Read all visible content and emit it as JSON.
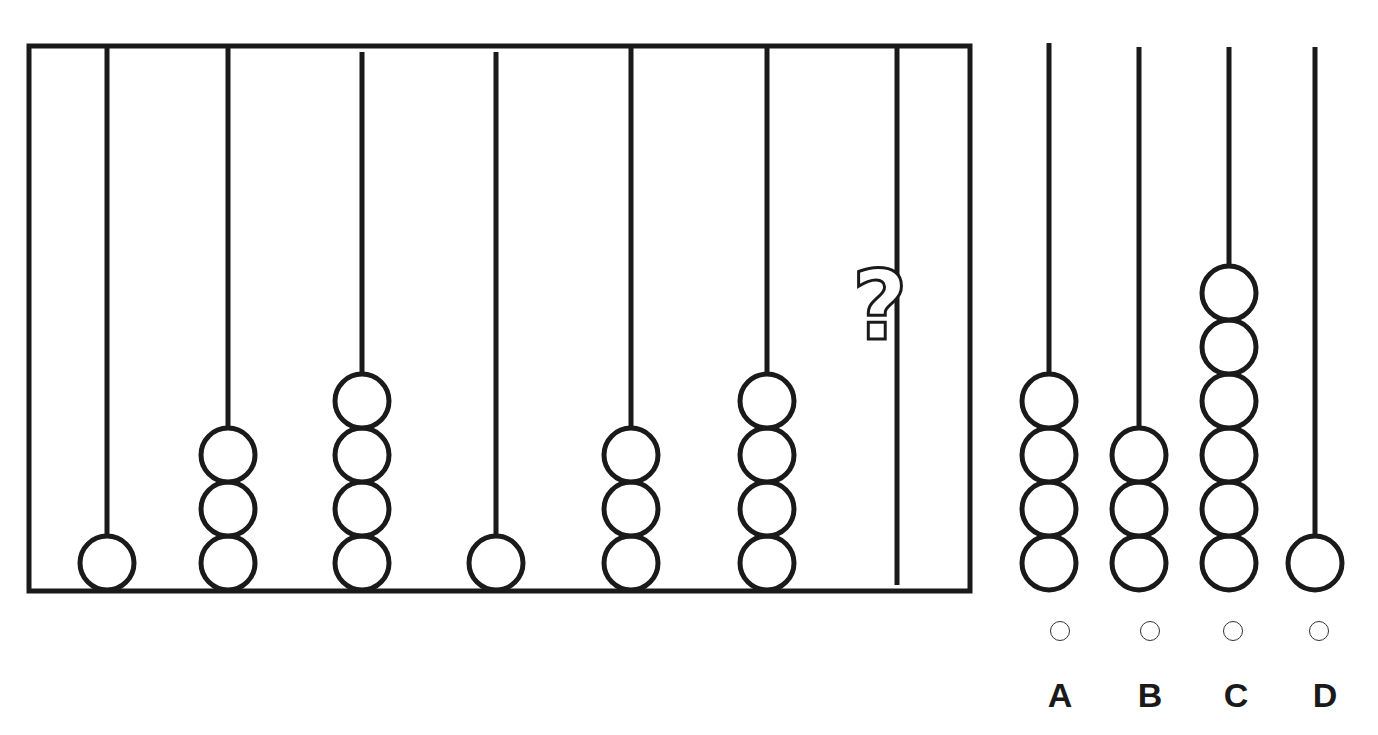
{
  "puzzle": {
    "type": "abacus-sequence",
    "stroke_color": "#1a1a1a",
    "background": "#ffffff",
    "frame": {
      "x": 29,
      "y": 46,
      "w": 941,
      "h": 545
    },
    "bead_radius": 27,
    "bead_base_y": 563,
    "bead_spacing": 54,
    "rods": [
      {
        "x": 107,
        "top": 47,
        "beads": 1
      },
      {
        "x": 228,
        "top": 47,
        "beads": 3
      },
      {
        "x": 362,
        "top": 52,
        "beads": 4
      },
      {
        "x": 496,
        "top": 52,
        "beads": 1
      },
      {
        "x": 631,
        "top": 47,
        "beads": 3
      },
      {
        "x": 767,
        "top": 47,
        "beads": 4
      },
      {
        "x": 897,
        "top": 47,
        "beads": null,
        "unknown": true
      }
    ],
    "question_mark": "?"
  },
  "options": [
    {
      "label": "A",
      "x": 1049,
      "top": 43,
      "beads": 4,
      "radio_x": 1060
    },
    {
      "label": "B",
      "x": 1139,
      "top": 47,
      "beads": 3,
      "radio_x": 1150
    },
    {
      "label": "C",
      "x": 1229,
      "top": 47,
      "beads": 6,
      "radio_x": 1233
    },
    {
      "label": "D",
      "x": 1315,
      "top": 47,
      "beads": 1,
      "radio_x": 1319
    }
  ],
  "labels": {
    "A": "A",
    "B": "B",
    "C": "C",
    "D": "D"
  }
}
